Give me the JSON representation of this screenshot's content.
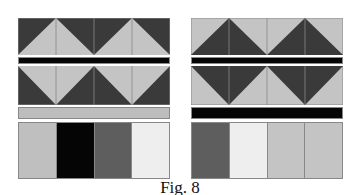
{
  "caption": "Fig. 8",
  "colors": {
    "dark": "#3a3a3a",
    "light": "#c4c4c4",
    "black": "#050505",
    "gray_strip": "#bdbdbd",
    "line": "#888888"
  },
  "left_panel": {
    "row1": {
      "background": "#3a3a3a",
      "triangles": "#c4c4c4",
      "orientation": "up"
    },
    "separator1": {
      "color": "#050505"
    },
    "row2": {
      "background": "#3a3a3a",
      "triangles": "#c4c4c4",
      "orientation": "down"
    },
    "separator2": {
      "color": "#bdbdbd"
    },
    "strips": [
      "#bfbfbf",
      "#050505",
      "#5e5e5e",
      "#eeeeee"
    ]
  },
  "right_panel": {
    "row1": {
      "background": "#c4c4c4",
      "triangles": "#3a3a3a",
      "orientation": "up"
    },
    "separator1": {
      "color": "#050505"
    },
    "row2": {
      "background": "#c4c4c4",
      "triangles": "#3a3a3a",
      "orientation": "down"
    },
    "separator2": {
      "color": "#050505"
    },
    "strips": [
      "#5e5e5e",
      "#eeeeee",
      "#c4c4c4",
      "#c4c4c4"
    ]
  }
}
